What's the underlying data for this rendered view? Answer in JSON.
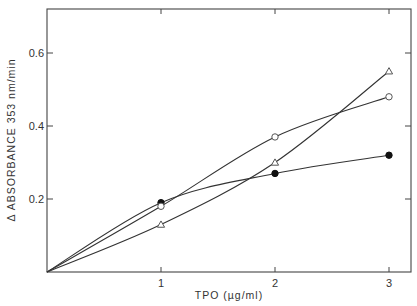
{
  "chart_data": {
    "type": "line",
    "title": "",
    "xlabel": "TPO  (µg/ml)",
    "ylabel": "Δ ABSORBANCE 353 nm/min",
    "xlim": [
      0,
      3.2
    ],
    "ylim": [
      0,
      0.72
    ],
    "x_ticks": [
      1,
      2,
      3
    ],
    "x_tick_labels": [
      "1",
      "2",
      "3"
    ],
    "y_ticks": [
      0.2,
      0.4,
      0.6
    ],
    "y_tick_labels": [
      "0.2",
      "0.4",
      "0.6"
    ],
    "grid": false,
    "legend": null,
    "series": [
      {
        "name": "filled circle",
        "marker": "filled-circle",
        "x": [
          0,
          1,
          2,
          3
        ],
        "values": [
          0,
          0.19,
          0.27,
          0.32
        ]
      },
      {
        "name": "open circle",
        "marker": "open-circle",
        "x": [
          0,
          1,
          2,
          3
        ],
        "values": [
          0,
          0.18,
          0.37,
          0.48
        ]
      },
      {
        "name": "open triangle",
        "marker": "open-triangle",
        "x": [
          0,
          1,
          2,
          3
        ],
        "values": [
          0,
          0.13,
          0.3,
          0.55
        ]
      }
    ]
  },
  "colors": {
    "line": "#333333",
    "axis": "#444444",
    "background": "#ffffff"
  }
}
